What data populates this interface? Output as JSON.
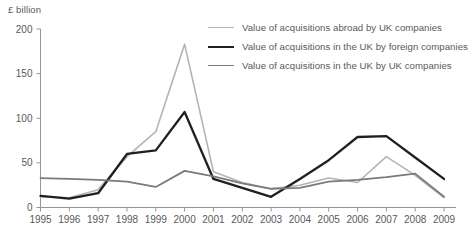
{
  "chart_data": {
    "type": "line",
    "title": "",
    "ylabel": "£ billion",
    "xlabel": "",
    "ylim": [
      0,
      200
    ],
    "yticks": [
      0,
      50,
      100,
      150,
      200
    ],
    "grid": false,
    "legend_position": "top-right",
    "x": [
      1995,
      1996,
      1997,
      1998,
      1999,
      2000,
      2001,
      2002,
      2003,
      2004,
      2005,
      2006,
      2007,
      2008,
      2009
    ],
    "categories": [
      "1995",
      "1996",
      "1997",
      "1998",
      "1999",
      "2000",
      "2001",
      "2002",
      "2003",
      "2004",
      "2005",
      "2006",
      "2007",
      "2008",
      "2009"
    ],
    "series": [
      {
        "name": "Value of acquisitions abroad by UK companies",
        "color": "#b4b4b4",
        "width": 1.6,
        "values": [
          12,
          11,
          20,
          57,
          85,
          183,
          40,
          28,
          21,
          25,
          33,
          28,
          57,
          36,
          11
        ]
      },
      {
        "name": "Value of acquisitions in the UK by foreign companies",
        "color": "#231f20",
        "width": 2.3,
        "values": [
          13,
          10,
          16,
          60,
          64,
          107,
          32,
          22,
          12,
          32,
          53,
          79,
          80,
          56,
          32
        ]
      },
      {
        "name": "Value of acquisitions in the UK by UK companies",
        "color": "#7a7a7a",
        "width": 1.8,
        "values": [
          33,
          32,
          31,
          29,
          23,
          41,
          35,
          27,
          21,
          22,
          29,
          31,
          34,
          38,
          12
        ]
      }
    ]
  },
  "axis": {
    "y_label": "£ billion",
    "y_ticks": [
      "0",
      "50",
      "100",
      "150",
      "200"
    ],
    "x_ticks": [
      "1995",
      "1996",
      "1997",
      "1998",
      "1999",
      "2000",
      "2001",
      "2002",
      "2003",
      "2004",
      "2005",
      "2006",
      "2007",
      "2008",
      "2009"
    ]
  },
  "legend": {
    "items": [
      {
        "label": "Value of acquisitions abroad by UK companies"
      },
      {
        "label": "Value of acquisitions in the UK by foreign companies"
      },
      {
        "label": "Value of acquisitions in the UK by UK companies"
      }
    ]
  },
  "caption": {
    "text": ""
  }
}
